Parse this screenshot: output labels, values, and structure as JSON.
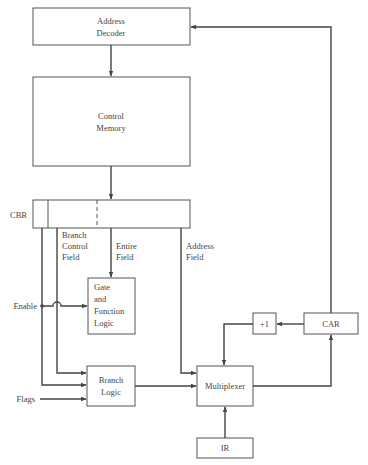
{
  "diagram": {
    "type": "microprogrammed control unit block diagram",
    "blocks": {
      "address_decoder": {
        "line1": "Address",
        "line2": "Decoder"
      },
      "control_memory": {
        "line1": "Control",
        "line2": "Memory"
      },
      "cbr": {
        "label": "CBR"
      },
      "gate_function_logic": {
        "line1": "Gate",
        "line2": "and",
        "line3": "Function",
        "line4": "Logic"
      },
      "branch_logic": {
        "line1": "Branch",
        "line2": "Logic"
      },
      "multiplexer": {
        "label": "Multiplexer"
      },
      "ir": {
        "label": "IR"
      },
      "incrementer": {
        "label": "+1"
      },
      "car": {
        "label": "CAR"
      }
    },
    "field_labels": {
      "branch_control": {
        "line1": "Branch",
        "line2": "Control",
        "line3": "Field"
      },
      "entire": {
        "line1": "Entire",
        "line2": "Field"
      },
      "address": {
        "line1": "Address",
        "line2": "Field"
      }
    },
    "signals": {
      "enable": "Enable",
      "flags": "Flags"
    },
    "connections": [
      {
        "from": "Address Decoder",
        "to": "Control Memory"
      },
      {
        "from": "Control Memory",
        "to": "CBR"
      },
      {
        "from": "CBR (entire field)",
        "to": "Gate and Function Logic"
      },
      {
        "from": "CBR (branch control field)",
        "to": "Branch Logic"
      },
      {
        "from": "CBR (enable bit)",
        "to": "Branch Logic"
      },
      {
        "from": "Enable",
        "to": "Gate and Function Logic"
      },
      {
        "from": "Flags",
        "to": "Branch Logic"
      },
      {
        "from": "CBR (address field)",
        "to": "Multiplexer"
      },
      {
        "from": "Branch Logic",
        "to": "Multiplexer"
      },
      {
        "from": "IR",
        "to": "Multiplexer"
      },
      {
        "from": "+1",
        "to": "Multiplexer"
      },
      {
        "from": "Multiplexer",
        "to": "CAR"
      },
      {
        "from": "CAR",
        "to": "+1"
      },
      {
        "from": "CAR",
        "to": "Address Decoder"
      }
    ]
  }
}
